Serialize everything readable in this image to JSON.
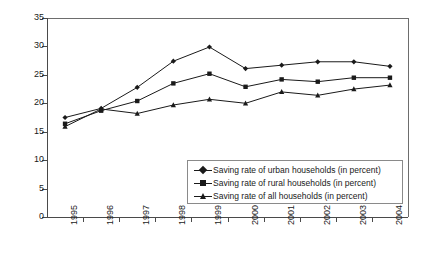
{
  "chart_data": {
    "type": "line",
    "title": "",
    "xlabel": "",
    "ylabel": "",
    "categories": [
      "1995",
      "1996",
      "1997",
      "1998",
      "1999",
      "2000",
      "2001",
      "2002",
      "2003",
      "2004"
    ],
    "ylim": [
      0,
      35
    ],
    "yticks": [
      0,
      5,
      10,
      15,
      20,
      25,
      30,
      35
    ],
    "grid": false,
    "legend_position": "inside-lower-right",
    "series": [
      {
        "name": "Saving rate of urban households (in percent)",
        "marker": "diamond",
        "color": "#1a1a1a",
        "values": [
          17.5,
          19.1,
          22.8,
          27.4,
          29.9,
          26.1,
          26.7,
          27.3,
          27.3,
          26.5
        ]
      },
      {
        "name": "Saving rate of rural households (in percent)",
        "marker": "square",
        "color": "#1a1a1a",
        "values": [
          16.4,
          18.7,
          20.4,
          23.5,
          25.2,
          22.9,
          24.2,
          23.8,
          24.5,
          24.5
        ]
      },
      {
        "name": "Saving rate of all households (in percent)",
        "marker": "triangle",
        "color": "#1a1a1a",
        "values": [
          15.9,
          19.0,
          18.2,
          19.7,
          20.7,
          20.0,
          22.0,
          21.4,
          22.5,
          23.2
        ]
      }
    ]
  },
  "legend": {
    "items": [
      {
        "label": "Saving rate of urban households (in percent)",
        "marker": "diamond"
      },
      {
        "label": "Saving rate of rural households (in percent)",
        "marker": "square"
      },
      {
        "label": "Saving rate of all households (in percent)",
        "marker": "triangle"
      }
    ]
  },
  "axes": {
    "y_tick_labels": [
      "0",
      "5",
      "10",
      "15",
      "20",
      "25",
      "30",
      "35"
    ],
    "x_tick_labels": [
      "1995",
      "1996",
      "1997",
      "1998",
      "1999",
      "2000",
      "2001",
      "2002",
      "2003",
      "2004"
    ]
  }
}
